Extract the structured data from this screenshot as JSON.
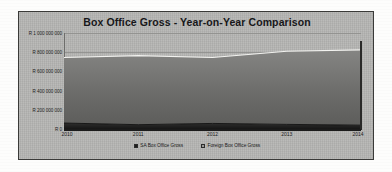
{
  "chart_data": {
    "type": "area",
    "stacked": true,
    "title": "Box Office Gross - Year-on-Year Comparison",
    "xlabel": "",
    "ylabel": "",
    "categories": [
      "2010",
      "2011",
      "2012",
      "2013",
      "2014"
    ],
    "x": [
      2010,
      2011,
      2012,
      2013,
      2014
    ],
    "ylim": [
      0,
      1000000000
    ],
    "yticks": [
      0,
      200000000,
      400000000,
      600000000,
      800000000,
      1000000000
    ],
    "ytick_labels": [
      "R 0",
      "R 200 000 000",
      "R 400 000 000",
      "R 600 000 000",
      "R 800 000 000",
      "R 1 000 000 000"
    ],
    "grid": true,
    "legend_position": "bottom",
    "currency_symbol": "R",
    "series": [
      {
        "name": "SA Box Office Gross",
        "color": "#1e1e1e",
        "values": [
          62000000,
          45000000,
          58000000,
          48000000,
          40000000
        ]
      },
      {
        "name": "Foreign Box Office Gross",
        "color": "#6e6e6c",
        "values": [
          683000000,
          720000000,
          687000000,
          762000000,
          785000000
        ]
      }
    ],
    "stacked_totals": [
      745000000,
      765000000,
      745000000,
      810000000,
      825000000
    ]
  },
  "legend": {
    "items": [
      {
        "label": "SA Box Office Gross",
        "swatch": "#1e1e1e"
      },
      {
        "label": "Foreign Box Office Gross",
        "swatch": "#9a9a98"
      }
    ]
  }
}
